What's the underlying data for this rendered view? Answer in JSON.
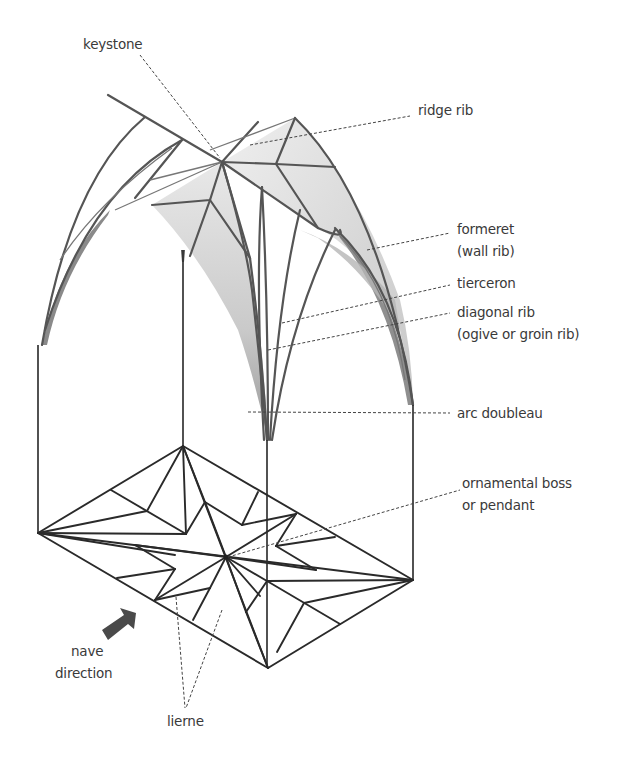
{
  "figure": {
    "colors": {
      "background": "#ffffff",
      "rib": "#555555",
      "plan_line": "#2a2a2a",
      "web_shading": "#c8c8c8",
      "web_shading_dark": "#8a8a8a",
      "arrow": "#4a4a4a",
      "text": "#3a3a3a"
    }
  },
  "labels": {
    "keystone": "keystone",
    "ridge_rib": "ridge rib",
    "formeret_1": "formeret",
    "formeret_2": "(wall rib)",
    "tierceron": "tierceron",
    "diagonal_rib_1": "diagonal rib",
    "diagonal_rib_2": "(ogive or groin rib)",
    "arc_doubleau": "arc doubleau",
    "boss_1": "ornamental boss",
    "boss_2": "or pendant",
    "nave_1": "nave",
    "nave_2": "direction",
    "lierne": "lierne"
  },
  "icons": {
    "nave_arrow": "thick-arrow-up-right"
  }
}
